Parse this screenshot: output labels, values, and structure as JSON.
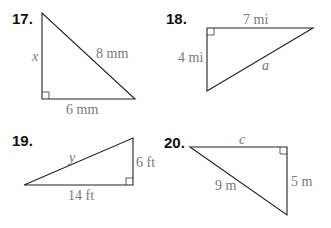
{
  "problems": [
    {
      "number": "17.",
      "legs": [
        "x",
        "6 mm"
      ],
      "hypotenuse": "8 mm",
      "labels": {
        "left_side": "x",
        "bottom_side": "6 mm",
        "hypotenuse": "8 mm"
      },
      "unknown": "x"
    },
    {
      "number": "18.",
      "legs": [
        "7 mi",
        "4 mi"
      ],
      "hypotenuse": "a",
      "labels": {
        "top_side": "7 mi",
        "left_side": "4 mi",
        "hypotenuse": "a"
      },
      "unknown": "a"
    },
    {
      "number": "19.",
      "legs": [
        "6 ft",
        "14 ft"
      ],
      "hypotenuse": "y",
      "labels": {
        "hypotenuse": "y",
        "right_side": "6 ft",
        "bottom_side": "14 ft"
      },
      "unknown": "y"
    },
    {
      "number": "20.",
      "legs": [
        "c",
        "5 m"
      ],
      "hypotenuse": "9 m",
      "labels": {
        "top_side": "c",
        "hypotenuse": "9 m",
        "right_side": "5 m"
      },
      "unknown": "c"
    }
  ],
  "colors": {
    "edge": "#222222",
    "label": "#7a7a7a",
    "number": "#111111"
  }
}
